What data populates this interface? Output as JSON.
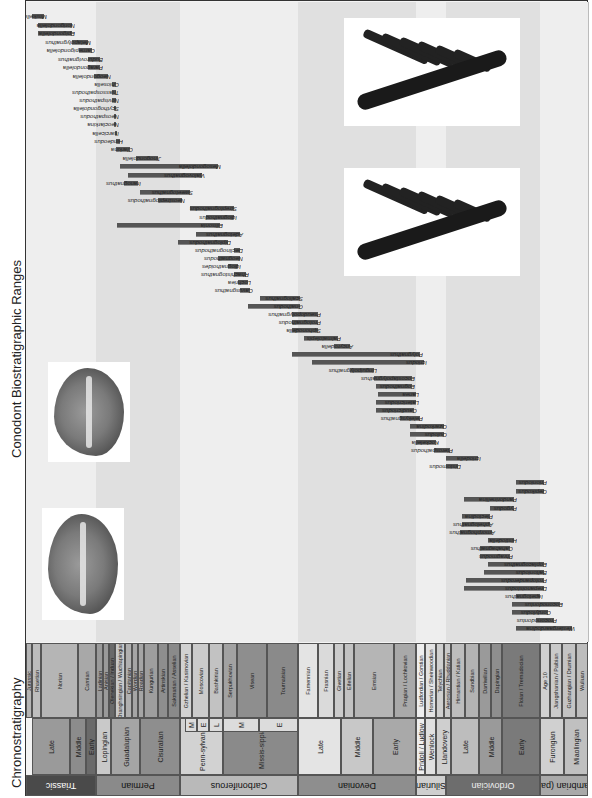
{
  "title": "Conodont Biostratigraphic Ranges",
  "chrono_title": "Chronostratigraphy",
  "colors": {
    "bar": "#555555",
    "frame": "#333333",
    "band_light": "#eeeeee",
    "band_dark": "#e0e0e0"
  },
  "systems": [
    {
      "label": "Triassic",
      "x": 26,
      "w": 70,
      "color": "#4a4a4a",
      "text": "#ffffff"
    },
    {
      "label": "Permian",
      "x": 96,
      "w": 84,
      "color": "#8a8a8a",
      "text": "#111111"
    },
    {
      "label": "Carboniferous",
      "x": 180,
      "w": 118,
      "color": "#b9b9b9",
      "text": "#111111"
    },
    {
      "label": "Devonian",
      "x": 298,
      "w": 118,
      "color": "#8e8e8e",
      "text": "#111111"
    },
    {
      "label": "Silurian",
      "x": 416,
      "w": 30,
      "color": "#cfcfcf",
      "text": "#111111"
    },
    {
      "label": "Ordovician",
      "x": 446,
      "w": 94,
      "color": "#6d6d6d",
      "text": "#eeeeee"
    },
    {
      "label": "Cambrian (part)",
      "x": 540,
      "w": 48,
      "color": "#a9a9a9",
      "text": "#111111"
    }
  ],
  "series": [
    {
      "label": "Late",
      "x": 32,
      "w": 38,
      "color": "#9a9a9a"
    },
    {
      "label": "Middle",
      "x": 70,
      "w": 16,
      "color": "#8c8c8c"
    },
    {
      "label": "Early",
      "x": 86,
      "w": 10,
      "color": "#6a6a6a"
    },
    {
      "label": "Lopingian",
      "x": 96,
      "w": 15,
      "color": "#c9c9c9"
    },
    {
      "label": "Guadalupian",
      "x": 111,
      "w": 29,
      "color": "#a5a5a5"
    },
    {
      "label": "Cisuralian",
      "x": 140,
      "w": 40,
      "color": "#8e8e8e"
    },
    {
      "label": "L",
      "x": 180,
      "w": 5,
      "color": "#dddddd"
    },
    {
      "label": "Penn-sylvanian",
      "x": 180,
      "w": 43,
      "color": "#d2d2d2"
    },
    {
      "label": "Missis-sippian",
      "x": 223,
      "w": 75,
      "color": "#8a8a8a"
    },
    {
      "label": "Late",
      "x": 298,
      "w": 43,
      "color": "#e4e4e4"
    },
    {
      "label": "Middle",
      "x": 341,
      "w": 32,
      "color": "#c8c8c8"
    },
    {
      "label": "Early",
      "x": 373,
      "w": 43,
      "color": "#a9a9a9"
    },
    {
      "label": "Pridoli / Ludlow",
      "x": 416,
      "w": 9,
      "color": "#eeeeee"
    },
    {
      "label": "Wenlock",
      "x": 425,
      "w": 11,
      "color": "#e0e0e0"
    },
    {
      "label": "Llandovery",
      "x": 436,
      "w": 15,
      "color": "#cfcfcf"
    },
    {
      "label": "Late",
      "x": 451,
      "w": 28,
      "color": "#bdbdbd"
    },
    {
      "label": "Middle",
      "x": 479,
      "w": 23,
      "color": "#9a9a9a"
    },
    {
      "label": "Early",
      "x": 502,
      "w": 38,
      "color": "#7a7a7a"
    },
    {
      "label": "Furongian",
      "x": 540,
      "w": 24,
      "color": "#d0d0d0"
    },
    {
      "label": "Miaolingian",
      "x": 564,
      "w": 24,
      "color": "#c0c0c0"
    }
  ],
  "series_sub": [
    {
      "label": "M",
      "x": 185,
      "w": 12
    },
    {
      "label": "E",
      "x": 197,
      "w": 12
    },
    {
      "label": "L",
      "x": 209,
      "w": 14
    },
    {
      "label": "M",
      "x": 223,
      "w": 36
    },
    {
      "label": "E",
      "x": 259,
      "w": 39
    }
  ],
  "stages": [
    {
      "label": "Jurassic",
      "x": 26,
      "w": 6,
      "color": "#b5b5b5"
    },
    {
      "label": "Rhaetian",
      "x": 32,
      "w": 9,
      "color": "#bdbdbd"
    },
    {
      "label": "Norian",
      "x": 41,
      "w": 37,
      "color": "#b5b5b5"
    },
    {
      "label": "Carnian",
      "x": 78,
      "w": 18,
      "color": "#a8a8a8"
    },
    {
      "label": "Ladinian",
      "x": 96,
      "w": 7,
      "color": "#9a9a9a"
    },
    {
      "label": "Anisian",
      "x": 103,
      "w": 6,
      "color": "#9a9a9a"
    },
    {
      "label": "Olenekian / Induan",
      "x": 109,
      "w": 6,
      "color": "#6a6a6a"
    },
    {
      "label": "Changhsingian / Wuchiapingian",
      "x": 115,
      "w": 10,
      "color": "#c9c9c9"
    },
    {
      "label": "Capitanian",
      "x": 125,
      "w": 7,
      "color": "#b0b0b0"
    },
    {
      "label": "Wordian",
      "x": 132,
      "w": 6,
      "color": "#a5a5a5"
    },
    {
      "label": "Roadian",
      "x": 138,
      "w": 6,
      "color": "#a5a5a5"
    },
    {
      "label": "Kungurian",
      "x": 144,
      "w": 14,
      "color": "#9e9e9e"
    },
    {
      "label": "Artinskian",
      "x": 158,
      "w": 10,
      "color": "#8e8e8e"
    },
    {
      "label": "Sakmarian / Asselian",
      "x": 168,
      "w": 12,
      "color": "#8a8a8a"
    },
    {
      "label": "Gzhelian / Kasimovian",
      "x": 180,
      "w": 12,
      "color": "#d2d2d2"
    },
    {
      "label": "Moscovian",
      "x": 192,
      "w": 17,
      "color": "#cbcbcb"
    },
    {
      "label": "Bashkirian",
      "x": 209,
      "w": 14,
      "color": "#c2c2c2"
    },
    {
      "label": "Serpukhovian",
      "x": 223,
      "w": 14,
      "color": "#a2a2a2"
    },
    {
      "label": "Visean",
      "x": 237,
      "w": 30,
      "color": "#8e8e8e"
    },
    {
      "label": "Tournaisian",
      "x": 267,
      "w": 31,
      "color": "#8a8a8a"
    },
    {
      "label": "Famennian",
      "x": 298,
      "w": 20,
      "color": "#e4e4e4"
    },
    {
      "label": "Frasnian",
      "x": 318,
      "w": 16,
      "color": "#dadada"
    },
    {
      "label": "Givetian",
      "x": 334,
      "w": 10,
      "color": "#cbcbcb"
    },
    {
      "label": "Eifelian",
      "x": 344,
      "w": 10,
      "color": "#c2c2c2"
    },
    {
      "label": "Emsian",
      "x": 354,
      "w": 40,
      "color": "#b5b5b5"
    },
    {
      "label": "Pragian / Lochkovian",
      "x": 394,
      "w": 22,
      "color": "#a9a9a9"
    },
    {
      "label": "Ludfordian / Gorstian",
      "x": 416,
      "w": 9,
      "color": "#eeeeee"
    },
    {
      "label": "Homerian / Sheinwoodian",
      "x": 425,
      "w": 11,
      "color": "#e2e2e2"
    },
    {
      "label": "Telychian",
      "x": 436,
      "w": 8,
      "color": "#cfcfcf"
    },
    {
      "label": "Aeronian / Rhuddanian",
      "x": 444,
      "w": 7,
      "color": "#c9c9c9"
    },
    {
      "label": "Hirnantian / Katian",
      "x": 451,
      "w": 14,
      "color": "#bdbdbd"
    },
    {
      "label": "Sandbian",
      "x": 465,
      "w": 14,
      "color": "#b3b3b3"
    },
    {
      "label": "Darriwilian",
      "x": 479,
      "w": 12,
      "color": "#9a9a9a"
    },
    {
      "label": "Dapingian",
      "x": 491,
      "w": 11,
      "color": "#8e8e8e"
    },
    {
      "label": "Floian / Tremadocian",
      "x": 502,
      "w": 38,
      "color": "#7a7a7a"
    },
    {
      "label": "Age 10",
      "x": 540,
      "w": 10,
      "color": "#d0d0d0"
    },
    {
      "label": "Jiangshanian / Paibian",
      "x": 550,
      "w": 12,
      "color": "#cacaca"
    },
    {
      "label": "Guzhangian / Drumian",
      "x": 562,
      "w": 14,
      "color": "#c4c4c4"
    },
    {
      "label": "Wuliuan",
      "x": 576,
      "w": 12,
      "color": "#bdbdbd"
    }
  ],
  "genera": [
    {
      "name": "Misikella",
      "start": 32,
      "end": 44,
      "y": 16
    },
    {
      "name": "Norigondolella",
      "start": 38,
      "end": 72,
      "y": 25
    },
    {
      "name": "Epigondolella",
      "start": 38,
      "end": 72,
      "y": 33
    },
    {
      "name": "Metapolygnathus",
      "start": 72,
      "end": 88,
      "y": 42
    },
    {
      "name": "Carnepigondolella",
      "start": 79,
      "end": 92,
      "y": 50
    },
    {
      "name": "Budurovignathus",
      "start": 88,
      "end": 100,
      "y": 59
    },
    {
      "name": "Paragondolella",
      "start": 88,
      "end": 100,
      "y": 67
    },
    {
      "name": "Neogondolella",
      "start": 94,
      "end": 108,
      "y": 76
    },
    {
      "name": "Chiosella",
      "start": 112,
      "end": 116,
      "y": 84
    },
    {
      "name": "Triassospathodus",
      "start": 112,
      "end": 116,
      "y": 92
    },
    {
      "name": "Novispathodus",
      "start": 112,
      "end": 116,
      "y": 100
    },
    {
      "name": "Scythogondolella",
      "start": 114,
      "end": 116,
      "y": 108
    },
    {
      "name": "Neospathodus",
      "start": 114,
      "end": 116,
      "y": 116
    },
    {
      "name": "Neoclarkina",
      "start": 114,
      "end": 116,
      "y": 124
    },
    {
      "name": "Isarcicella",
      "start": 115,
      "end": 116,
      "y": 133
    },
    {
      "name": "Hindeodus",
      "start": 116,
      "end": 120,
      "y": 141
    },
    {
      "name": "Clarkina",
      "start": 116,
      "end": 130,
      "y": 149
    },
    {
      "name": "Jinogondolella",
      "start": 136,
      "end": 158,
      "y": 158
    },
    {
      "name": "Mesogondolella",
      "start": 120,
      "end": 218,
      "y": 166
    },
    {
      "name": "Vjalovognathus",
      "start": 128,
      "end": 202,
      "y": 175
    },
    {
      "name": "Iranognathus",
      "start": 124,
      "end": 138,
      "y": 183
    },
    {
      "name": "Sweetognathus",
      "start": 140,
      "end": 190,
      "y": 192
    },
    {
      "name": "Neostreptognathodus",
      "start": 158,
      "end": 182,
      "y": 200
    },
    {
      "name": "Streptognathodus",
      "start": 190,
      "end": 234,
      "y": 208
    },
    {
      "name": "Idiognathodus",
      "start": 206,
      "end": 234,
      "y": 217
    },
    {
      "name": "Ellisonia",
      "start": 117,
      "end": 220,
      "y": 225
    },
    {
      "name": "Adetognathus",
      "start": 196,
      "end": 240,
      "y": 234
    },
    {
      "name": "Diplognathodus",
      "start": 178,
      "end": 228,
      "y": 242
    },
    {
      "name": "Declinognathodus",
      "start": 234,
      "end": 240,
      "y": 250
    },
    {
      "name": "Neognathodus",
      "start": 218,
      "end": 240,
      "y": 258
    },
    {
      "name": "Idiognathoides",
      "start": 228,
      "end": 238,
      "y": 266
    },
    {
      "name": "Rhachistognathus",
      "start": 234,
      "end": 246,
      "y": 274
    },
    {
      "name": "Lochriea",
      "start": 238,
      "end": 248,
      "y": 282
    },
    {
      "name": "Cavusgnathus",
      "start": 240,
      "end": 250,
      "y": 290
    },
    {
      "name": "Scaliognathus",
      "start": 260,
      "end": 300,
      "y": 298
    },
    {
      "name": "Gnathodus",
      "start": 248,
      "end": 300,
      "y": 306
    },
    {
      "name": "Pseudopolygnathus",
      "start": 292,
      "end": 318,
      "y": 314
    },
    {
      "name": "Protognathodus",
      "start": 292,
      "end": 318,
      "y": 322
    },
    {
      "name": "Siphonodella",
      "start": 292,
      "end": 318,
      "y": 330
    },
    {
      "name": "Palmatolepis",
      "start": 304,
      "end": 338,
      "y": 338
    },
    {
      "name": "Ancyrodella",
      "start": 334,
      "end": 350,
      "y": 346
    },
    {
      "name": "Polygnathus",
      "start": 292,
      "end": 420,
      "y": 354
    },
    {
      "name": "Icriodus",
      "start": 312,
      "end": 424,
      "y": 362
    },
    {
      "name": "Linguipolygnathus",
      "start": 350,
      "end": 374,
      "y": 370
    },
    {
      "name": "Eocostapolygnathus",
      "start": 374,
      "end": 412,
      "y": 378
    },
    {
      "name": "Eognathodus",
      "start": 376,
      "end": 412,
      "y": 386
    },
    {
      "name": "Lanea",
      "start": 378,
      "end": 416,
      "y": 394
    },
    {
      "name": "Latericriodus",
      "start": 376,
      "end": 416,
      "y": 402
    },
    {
      "name": "Caudicriodus",
      "start": 376,
      "end": 414,
      "y": 410
    },
    {
      "name": "Pelekysgnathus",
      "start": 400,
      "end": 420,
      "y": 418
    },
    {
      "name": "Ozarkodina",
      "start": 410,
      "end": 444,
      "y": 426
    },
    {
      "name": "Oulodus",
      "start": 410,
      "end": 444,
      "y": 434
    },
    {
      "name": "Kockelella",
      "start": 416,
      "end": 436,
      "y": 442
    },
    {
      "name": "Pterospathodus",
      "start": 434,
      "end": 450,
      "y": 450
    },
    {
      "name": "Icriodella",
      "start": 446,
      "end": 478,
      "y": 458
    },
    {
      "name": "Distomodus",
      "start": 446,
      "end": 458,
      "y": 466
    },
    {
      "name": "Prioniodus",
      "start": 516,
      "end": 544,
      "y": 482
    },
    {
      "name": "Oepikodus",
      "start": 516,
      "end": 544,
      "y": 491
    },
    {
      "name": "Pandorinellina",
      "start": 464,
      "end": 514,
      "y": 499
    },
    {
      "name": "Pygodus",
      "start": 490,
      "end": 514,
      "y": 508
    },
    {
      "name": "Plectodina",
      "start": 462,
      "end": 490,
      "y": 516
    },
    {
      "name": "Aphelognathus",
      "start": 462,
      "end": 490,
      "y": 524
    },
    {
      "name": "Amorphognathus",
      "start": 460,
      "end": 492,
      "y": 532
    },
    {
      "name": "Histiodella",
      "start": 488,
      "end": 514,
      "y": 540
    },
    {
      "name": "Cahabagnathus",
      "start": 480,
      "end": 510,
      "y": 548
    },
    {
      "name": "Phragmodus",
      "start": 480,
      "end": 510,
      "y": 556
    },
    {
      "name": "Eoplacognathus",
      "start": 488,
      "end": 544,
      "y": 564
    },
    {
      "name": "Baltoniodus",
      "start": 484,
      "end": 544,
      "y": 572
    },
    {
      "name": "Protopanderodus",
      "start": 466,
      "end": 544,
      "y": 580
    },
    {
      "name": "Drepanoistodus",
      "start": 464,
      "end": 544,
      "y": 588
    },
    {
      "name": "Iapetognathus",
      "start": 516,
      "end": 540,
      "y": 596
    },
    {
      "name": "Eoconodontus",
      "start": 512,
      "end": 560,
      "y": 604
    },
    {
      "name": "Cordylodus",
      "start": 512,
      "end": 548,
      "y": 612
    },
    {
      "name": "Proconodontus",
      "start": 536,
      "end": 554,
      "y": 620
    },
    {
      "name": "Westergaardodina",
      "start": 516,
      "end": 572,
      "y": 628
    }
  ],
  "photos": [
    {
      "name": "conodont-element-photo-1",
      "x": 42,
      "y": 508,
      "w": 82,
      "h": 112,
      "kind": "platform"
    },
    {
      "name": "conodont-element-photo-2",
      "x": 48,
      "y": 362,
      "w": 82,
      "h": 100,
      "kind": "platform"
    },
    {
      "name": "conodont-element-photo-3",
      "x": 344,
      "y": 18,
      "w": 176,
      "h": 108,
      "kind": "ramiform"
    },
    {
      "name": "conodont-element-photo-4",
      "x": 344,
      "y": 168,
      "w": 176,
      "h": 108,
      "kind": "ramiform"
    }
  ]
}
